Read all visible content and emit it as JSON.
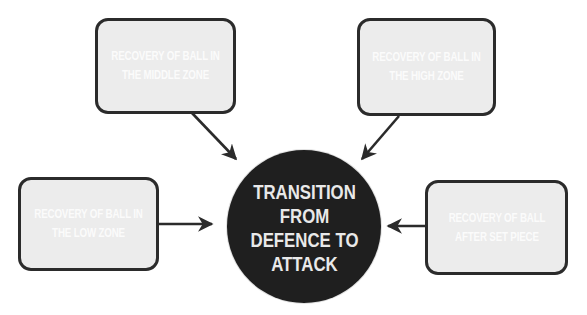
{
  "diagram": {
    "center": {
      "lines": [
        "TRANSITION",
        "FROM",
        "DEFENCE TO",
        "ATTACK"
      ],
      "fill_color": "#1f1f1f",
      "text_color": "#e9e9e9"
    },
    "nodes": [
      {
        "id": "middle-zone",
        "lines": [
          "RECOVERY OF BALL IN",
          "THE MIDDLE ZONE"
        ],
        "position": "top-left"
      },
      {
        "id": "high-zone",
        "lines": [
          "RECOVERY OF BALL IN",
          "THE HIGH ZONE"
        ],
        "position": "top-right"
      },
      {
        "id": "low-zone",
        "lines": [
          "RECOVERY OF BALL IN",
          "THE LOW ZONE"
        ],
        "position": "left"
      },
      {
        "id": "set-piece",
        "lines": [
          "RECOVERY OF BALL",
          "AFTER SET PIECE"
        ],
        "position": "right"
      }
    ],
    "edges": [
      {
        "from": "middle-zone",
        "to": "center"
      },
      {
        "from": "high-zone",
        "to": "center"
      },
      {
        "from": "low-zone",
        "to": "center"
      },
      {
        "from": "set-piece",
        "to": "center"
      }
    ],
    "colors": {
      "box_fill": "#ececec",
      "box_border": "#2b2b2b",
      "box_text": "#fbfbfb",
      "arrow": "#2b2b2b"
    }
  }
}
